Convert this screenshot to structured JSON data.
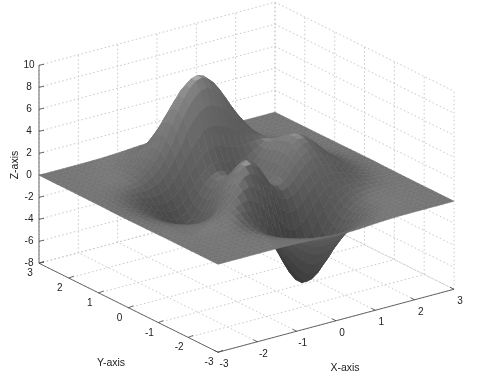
{
  "chart_data": {
    "type": "surface",
    "function": "peaks",
    "formula": "3*(1-x)^2*exp(-x^2-(y+1)^2) - 10*(x/5-x^3-y^5)*exp(-x^2-y^2) - 1/3*exp(-(x+1)^2-y^2)",
    "title": "",
    "xlabel": "X-axis",
    "ylabel": "Y-axis",
    "zlabel": "Z-axis",
    "xlim": [
      -3,
      3
    ],
    "ylim": [
      -3,
      3
    ],
    "zlim": [
      -8,
      10
    ],
    "xticks": [
      "-3",
      "-2",
      "-1",
      "0",
      "1",
      "2",
      "3"
    ],
    "yticks": [
      "-3",
      "-2",
      "-1",
      "0",
      "1",
      "2",
      "3"
    ],
    "zticks": [
      "-8",
      "-6",
      "-4",
      "-2",
      "0",
      "2",
      "4",
      "6",
      "8",
      "10"
    ],
    "grid": true,
    "colormap": "gray",
    "surface_features": {
      "max_peak": {
        "x": 0,
        "y": 1.6,
        "z": 8.1
      },
      "secondary_peak": {
        "x": -0.5,
        "y": -0.6,
        "z": 3.8
      },
      "min_pit": {
        "x": 0.2,
        "y": -1.6,
        "z": -6.5
      },
      "secondary_pit": {
        "x": -1.4,
        "y": 0.2,
        "z": -3.0
      }
    }
  },
  "axes_labels": {
    "x": "X-axis",
    "y": "Y-axis",
    "z": "Z-axis"
  },
  "colors": {
    "background": "#ffffff",
    "axis_line": "#444444",
    "grid_line": "#c8c8c8",
    "text": "#222222"
  }
}
